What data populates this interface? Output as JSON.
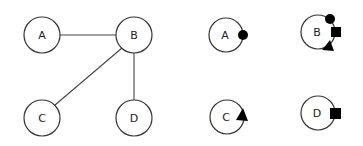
{
  "graph": {
    "nodes": [
      {
        "id": "A",
        "label": "A",
        "x": 42,
        "y": 35
      },
      {
        "id": "B",
        "label": "B",
        "x": 134,
        "y": 35
      },
      {
        "id": "C",
        "label": "C",
        "x": 42,
        "y": 118
      },
      {
        "id": "D",
        "label": "D",
        "x": 134,
        "y": 118
      }
    ],
    "edges": [
      [
        "A",
        "B"
      ],
      [
        "B",
        "C"
      ],
      [
        "B",
        "D"
      ]
    ]
  },
  "decomposed": {
    "nodes": [
      {
        "id": "A",
        "label": "A",
        "x": 226,
        "y": 35,
        "marks": [
          "circle"
        ]
      },
      {
        "id": "B",
        "label": "B",
        "x": 318,
        "y": 32,
        "marks": [
          "circle",
          "square",
          "triangle"
        ]
      },
      {
        "id": "C",
        "label": "C",
        "x": 227,
        "y": 117,
        "marks": [
          "triangle"
        ]
      },
      {
        "id": "D",
        "label": "D",
        "x": 318,
        "y": 113,
        "marks": [
          "square"
        ]
      }
    ]
  }
}
